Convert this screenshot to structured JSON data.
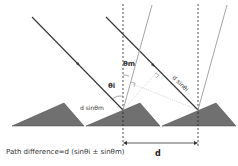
{
  "diagram": {
    "labels": {
      "theta_m": "θm",
      "theta_i": "θi",
      "d_sin_theta_m": "d sinθm",
      "d_sin_theta_i": "d sinθi",
      "d": "d"
    },
    "caption": "Path difference=d (sinθi ± sinθm)",
    "colors": {
      "grating_fill": "#707070",
      "ray": "#333333",
      "diffracted_ray": "#9a9a9a",
      "dashed_line": "#222222"
    }
  }
}
